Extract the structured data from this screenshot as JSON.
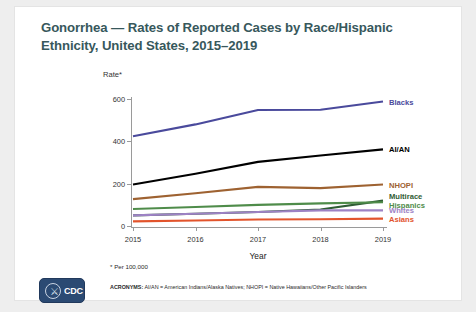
{
  "slide": {
    "title": "Gonorrhea — Rates of Reported Cases by Race/Hispanic Ethnicity, United States, 2015–2019",
    "title_color": "#37585c",
    "background_color": "#ffffff",
    "frame_color": "#eeeeee"
  },
  "footnotes": {
    "rate_note": "* Per 100,000",
    "acronyms_label": "ACRONYMS:",
    "acronyms_text": " AI/AN = American Indians/Alaska Natives; NHOPI = Native Hawaiians/Other Pacific Islanders"
  },
  "logo": {
    "wordmark": "CDC",
    "seal_glyph": "⚔",
    "background_color": "#2b4a73",
    "name": "cdc-logo"
  },
  "chart_data": {
    "type": "line",
    "title": "Gonorrhea — Rates of Reported Cases by Race/Hispanic Ethnicity, United States, 2015–2019",
    "subtitle": "",
    "xlabel": "Year",
    "ylabel": "Rate*",
    "x": [
      2015,
      2016,
      2017,
      2018,
      2019
    ],
    "xticklabels": [
      "2015",
      "2016",
      "2017",
      "2018",
      "2019"
    ],
    "yticks": [
      0,
      200,
      400,
      600
    ],
    "yticklabels": [
      "0",
      "200",
      "400",
      "600"
    ],
    "xlim": [
      2015,
      2019
    ],
    "ylim": [
      0,
      600
    ],
    "grid": false,
    "legend_position": "right-of-line-ends",
    "series": [
      {
        "name": "Blacks",
        "color": "#4a4a9c",
        "values": [
          424,
          480,
          548,
          549,
          588
        ]
      },
      {
        "name": "AI/AN",
        "color": "#000000",
        "values": [
          196,
          247,
          303,
          333,
          362
        ]
      },
      {
        "name": "NHOPI",
        "color": "#9e6231",
        "values": [
          127,
          155,
          185,
          179,
          196
        ]
      },
      {
        "name": "Multirace",
        "color": "#2f5d34",
        "values": [
          50,
          58,
          66,
          78,
          120
        ]
      },
      {
        "name": "Hispanics",
        "color": "#4f8c4a",
        "values": [
          80,
          90,
          100,
          107,
          112
        ]
      },
      {
        "name": "Whites",
        "color": "#9d82c4",
        "values": [
          50,
          58,
          66,
          74,
          74
        ]
      },
      {
        "name": "Asians",
        "color": "#e2542c",
        "values": [
          22,
          26,
          31,
          32,
          35
        ]
      }
    ]
  }
}
